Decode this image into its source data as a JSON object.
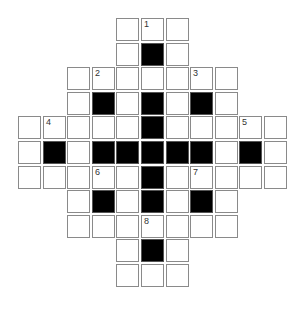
{
  "puzzle": {
    "type": "crossword",
    "cols": 11,
    "rows": 11,
    "origin": {
      "x": 18,
      "y": 18
    },
    "pitch": 24.6,
    "cell_size": 23,
    "colors": {
      "white": "#ffffff",
      "black": "#000000",
      "border": "#8a8a8a",
      "number": "#333333"
    },
    "layout": [
      {
        "row": 0,
        "cols": [
          4,
          5,
          6
        ],
        "black": []
      },
      {
        "row": 1,
        "cols": [
          4,
          5,
          6
        ],
        "black": [
          5
        ]
      },
      {
        "row": 2,
        "cols": [
          2,
          3,
          4,
          5,
          6,
          7,
          8
        ],
        "black": []
      },
      {
        "row": 3,
        "cols": [
          2,
          3,
          4,
          5,
          6,
          7,
          8
        ],
        "black": [
          3,
          5,
          7
        ]
      },
      {
        "row": 4,
        "cols": [
          0,
          1,
          2,
          3,
          4,
          5,
          6,
          7,
          8,
          9,
          10
        ],
        "black": [
          5
        ]
      },
      {
        "row": 5,
        "cols": [
          0,
          1,
          2,
          3,
          4,
          5,
          6,
          7,
          8,
          9,
          10
        ],
        "black": [
          1,
          3,
          4,
          5,
          6,
          7,
          9
        ]
      },
      {
        "row": 6,
        "cols": [
          0,
          1,
          2,
          3,
          4,
          5,
          6,
          7,
          8,
          9,
          10
        ],
        "black": [
          5
        ]
      },
      {
        "row": 7,
        "cols": [
          2,
          3,
          4,
          5,
          6,
          7,
          8
        ],
        "black": [
          3,
          5,
          7
        ]
      },
      {
        "row": 8,
        "cols": [
          2,
          3,
          4,
          5,
          6,
          7,
          8
        ],
        "black": []
      },
      {
        "row": 9,
        "cols": [
          4,
          5,
          6
        ],
        "black": [
          5
        ]
      },
      {
        "row": 10,
        "cols": [
          4,
          5,
          6
        ],
        "black": []
      }
    ],
    "numbers": [
      {
        "row": 0,
        "col": 5,
        "label": "1"
      },
      {
        "row": 2,
        "col": 3,
        "label": "2"
      },
      {
        "row": 2,
        "col": 7,
        "label": "3"
      },
      {
        "row": 4,
        "col": 1,
        "label": "4"
      },
      {
        "row": 4,
        "col": 9,
        "label": "5"
      },
      {
        "row": 6,
        "col": 3,
        "label": "6"
      },
      {
        "row": 6,
        "col": 7,
        "label": "7"
      },
      {
        "row": 8,
        "col": 5,
        "label": "8"
      }
    ]
  }
}
